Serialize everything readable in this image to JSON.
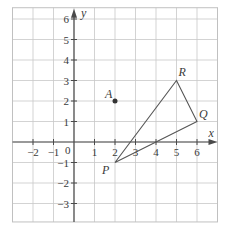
{
  "figure": {
    "type": "coordinate-grid",
    "axes": {
      "x_label": "x",
      "y_label": "y",
      "origin_label": "0",
      "x_ticks": [
        {
          "value": -2,
          "label": "−2"
        },
        {
          "value": -1,
          "label": "−1"
        },
        {
          "value": 1,
          "label": "1"
        },
        {
          "value": 2,
          "label": "2"
        },
        {
          "value": 3,
          "label": "3"
        },
        {
          "value": 4,
          "label": "4"
        },
        {
          "value": 5,
          "label": "5"
        },
        {
          "value": 6,
          "label": "6"
        }
      ],
      "y_ticks": [
        {
          "value": 6,
          "label": "6"
        },
        {
          "value": 5,
          "label": "5"
        },
        {
          "value": 4,
          "label": "4"
        },
        {
          "value": 3,
          "label": "3"
        },
        {
          "value": 2,
          "label": "2"
        },
        {
          "value": 1,
          "label": "1"
        },
        {
          "value": -1,
          "label": "−1"
        },
        {
          "value": -2,
          "label": "−2"
        },
        {
          "value": -3,
          "label": "−3"
        }
      ],
      "x_range": [
        -3,
        7
      ],
      "y_range": [
        -3.9,
        6.55
      ]
    },
    "grid": true,
    "points": [
      {
        "label": "A",
        "x": 2,
        "y": 2,
        "marked": true
      },
      {
        "label": "P",
        "x": 2,
        "y": -1,
        "marked": false
      },
      {
        "label": "Q",
        "x": 6,
        "y": 1,
        "marked": false
      },
      {
        "label": "R",
        "x": 5,
        "y": 3,
        "marked": false
      }
    ],
    "polygon": {
      "name": "triangle PQR",
      "vertices": [
        "P",
        "Q",
        "R"
      ]
    },
    "colors": {
      "grid": "#c8c8c8",
      "axis": "#4a4a4a",
      "line": "#555555",
      "text": "#3a3a3a",
      "background": "#ffffff"
    }
  }
}
